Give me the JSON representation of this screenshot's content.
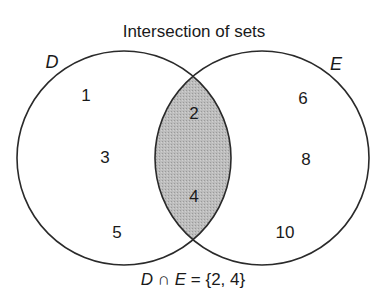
{
  "title": "Intersection of sets",
  "sets": {
    "D": {
      "label": "D",
      "only": [
        "1",
        "3",
        "5"
      ]
    },
    "E": {
      "label": "E",
      "only": [
        "6",
        "8",
        "10"
      ]
    }
  },
  "intersection": [
    "2",
    "4"
  ],
  "formula": {
    "left": "D",
    "op": "∩",
    "right": "E",
    "rest": "= {2, 4}"
  },
  "colors": {
    "stroke": "#2a2a2a",
    "intersection_fill": "#b5b5b5",
    "background": "#ffffff"
  }
}
